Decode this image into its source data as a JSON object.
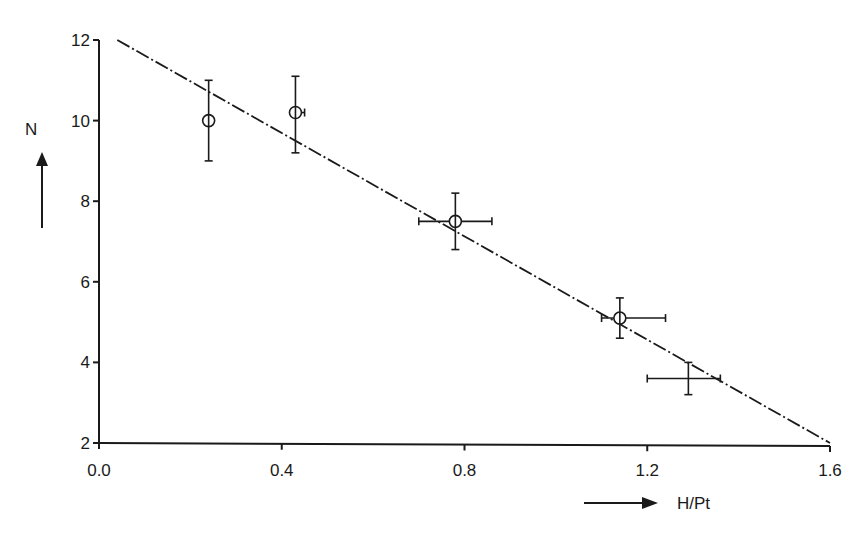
{
  "chart_data": {
    "type": "scatter",
    "title": "",
    "xlabel": "H/Pt",
    "ylabel": "N",
    "xlim": [
      0.0,
      1.6
    ],
    "ylim": [
      2,
      12
    ],
    "xticks": [
      "0.0",
      "0.4",
      "0.8",
      "1.2",
      "1.6"
    ],
    "yticks": [
      "2",
      "4",
      "6",
      "8",
      "10",
      "12"
    ],
    "grid": false,
    "legend": null,
    "series": [
      {
        "name": "measured",
        "marker": "open-circle",
        "points": [
          {
            "x": 0.24,
            "y": 10.0,
            "yerr": [
              9.0,
              11.0
            ]
          },
          {
            "x": 0.43,
            "y": 10.2,
            "xerr": [
              0.42,
              0.45
            ],
            "yerr": [
              9.2,
              11.1
            ]
          },
          {
            "x": 0.78,
            "y": 7.5,
            "xerr": [
              0.7,
              0.86
            ],
            "yerr": [
              6.8,
              8.2
            ]
          },
          {
            "x": 1.14,
            "y": 5.1,
            "xerr": [
              1.1,
              1.24
            ],
            "yerr": [
              4.6,
              5.6
            ]
          },
          {
            "x": 1.29,
            "y": 3.6,
            "marker": "none",
            "xerr": [
              1.2,
              1.36
            ],
            "yerr": [
              3.2,
              4.0
            ]
          }
        ]
      },
      {
        "name": "linear fit",
        "type": "line",
        "style": "dash-dot",
        "x": [
          0.04,
          1.6
        ],
        "y": [
          12.0,
          2.0
        ]
      }
    ],
    "annotations": [
      "arrow pointing up beside N",
      "arrow pointing right before H/Pt"
    ]
  },
  "labels": {
    "y_axis": "N",
    "x_axis": "H/Pt",
    "x_ticks": [
      "0.0",
      "0.4",
      "0.8",
      "1.2",
      "1.6"
    ],
    "y_ticks": [
      "2",
      "4",
      "6",
      "8",
      "10",
      "12"
    ]
  }
}
